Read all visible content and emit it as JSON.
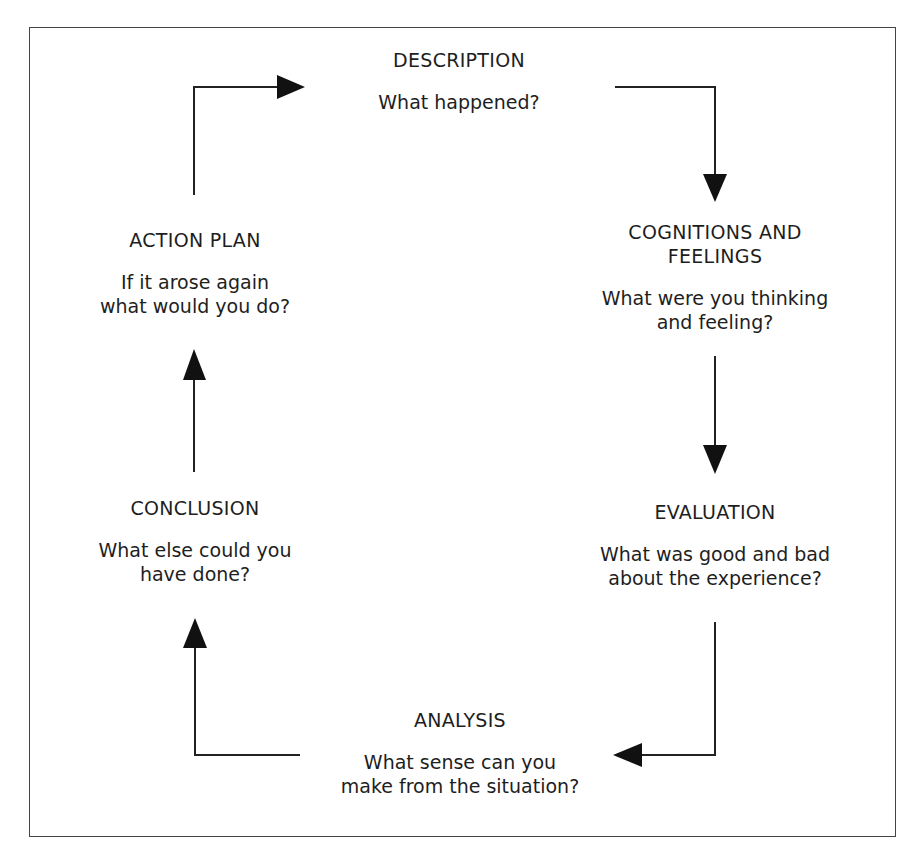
{
  "diagram": {
    "type": "cycle",
    "nodes": [
      {
        "id": "description",
        "title": "DESCRIPTION",
        "question": "What happened?"
      },
      {
        "id": "cognitions",
        "title": "COGNITIONS AND FEELINGS",
        "question": "What were you thinking and feeling?"
      },
      {
        "id": "evaluation",
        "title": "EVALUATION",
        "question": "What was good and bad about the experience?"
      },
      {
        "id": "analysis",
        "title": "ANALYSIS",
        "question": "What sense can you make from the situation?"
      },
      {
        "id": "conclusion",
        "title": "CONCLUSION",
        "question": "What else could you have done?"
      },
      {
        "id": "action_plan",
        "title": "ACTION PLAN",
        "question": "If it arose again what would you do?"
      }
    ],
    "edges": [
      {
        "from": "description",
        "to": "cognitions"
      },
      {
        "from": "cognitions",
        "to": "evaluation"
      },
      {
        "from": "evaluation",
        "to": "analysis"
      },
      {
        "from": "analysis",
        "to": "conclusion"
      },
      {
        "from": "conclusion",
        "to": "action_plan"
      },
      {
        "from": "action_plan",
        "to": "description"
      }
    ]
  },
  "labels": {
    "description_title": "DESCRIPTION",
    "description_q": "What happened?",
    "cognitions_title_1": "COGNITIONS AND",
    "cognitions_title_2": "FEELINGS",
    "cognitions_q_1": "What were you thinking",
    "cognitions_q_2": "and feeling?",
    "evaluation_title": "EVALUATION",
    "evaluation_q_1": "What was good and bad",
    "evaluation_q_2": "about the experience?",
    "analysis_title": "ANALYSIS",
    "analysis_q_1": "What sense can you",
    "analysis_q_2": "make from the situation?",
    "conclusion_title": "CONCLUSION",
    "conclusion_q_1": "What else could you",
    "conclusion_q_2": "have done?",
    "action_title": "ACTION PLAN",
    "action_q_1": "If it arose again",
    "action_q_2": "what would you do?"
  }
}
